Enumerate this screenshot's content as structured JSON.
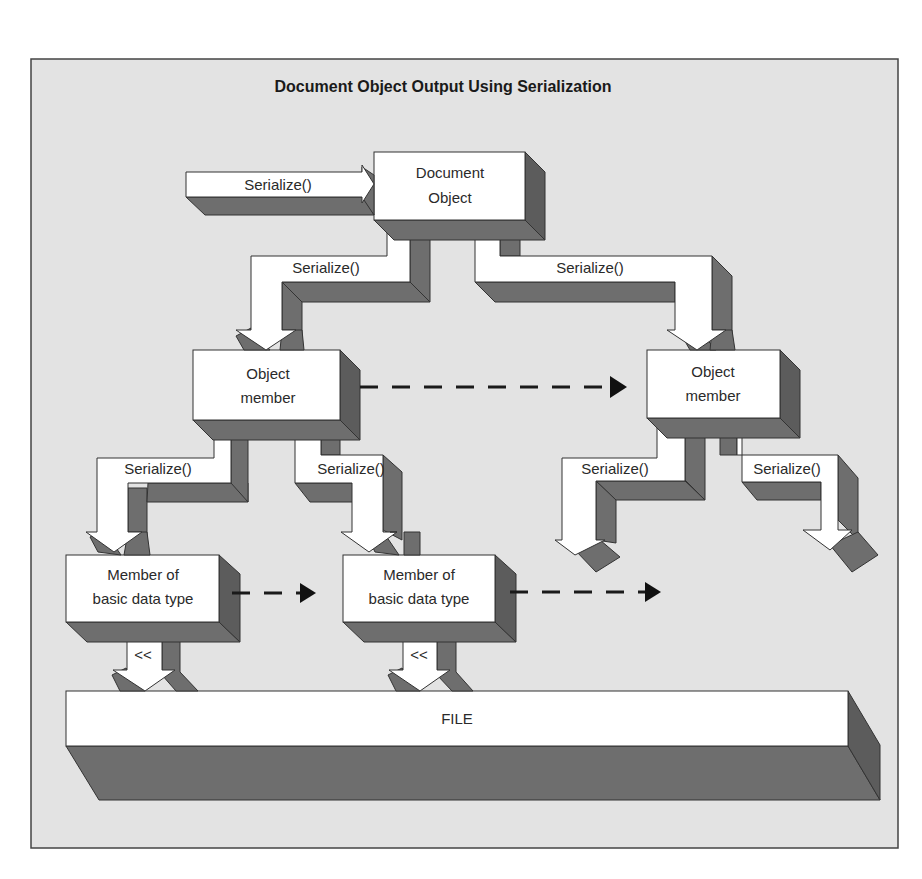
{
  "figure": {
    "title": "Document Object Output Using Serialization",
    "colors": {
      "background": "#e3e3e3",
      "box_fill": "#ffffff",
      "shadow": "#6e6e6e",
      "outline": "#333333",
      "dashed_arrow": "#1a1a1a"
    }
  },
  "nodes": {
    "document_object": {
      "line1": "Document",
      "line2": "Object"
    },
    "object_member_left": {
      "line1": "Object",
      "line2": "member"
    },
    "object_member_right": {
      "line1": "Object",
      "line2": "member"
    },
    "basic_member_1": {
      "line1": "Member of",
      "line2": "basic data type"
    },
    "basic_member_2": {
      "line1": "Member of",
      "line2": "basic data type"
    },
    "file": {
      "label": "FILE"
    }
  },
  "edges": {
    "input": {
      "label": "Serialize()"
    },
    "doc_to_left": {
      "label": "Serialize()"
    },
    "doc_to_right": {
      "label": "Serialize()"
    },
    "left_to_basic1": {
      "label": "Serialize()"
    },
    "left_to_basic2": {
      "label": "Serialize()"
    },
    "right_to_out1": {
      "label": "Serialize()"
    },
    "right_to_out2": {
      "label": "Serialize()"
    },
    "basic1_to_file": {
      "label": "<<"
    },
    "basic2_to_file": {
      "label": "<<"
    }
  }
}
